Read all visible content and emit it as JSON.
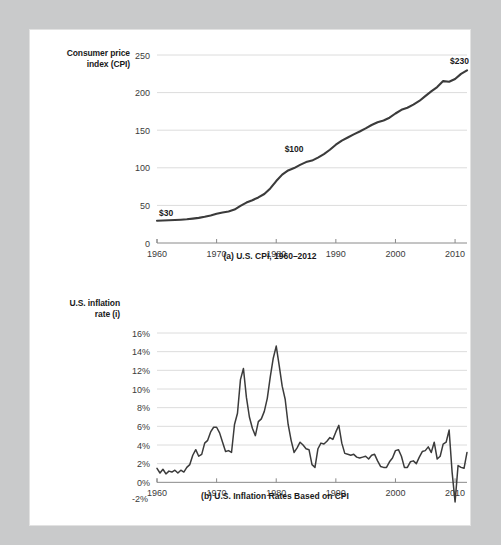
{
  "page": {
    "background_color": "#c9cacb",
    "paper_color": "#ffffff"
  },
  "figure_a": {
    "y_axis_title_line1": "Consumer price",
    "y_axis_title_line2": "index (CPI)",
    "caption": "(a) U.S. CPI, 1960–2012",
    "y_ticks": [
      "0",
      "50",
      "100",
      "150",
      "200",
      "250"
    ],
    "x_ticks": [
      "1960",
      "1970",
      "1980",
      "1990",
      "2000",
      "2010"
    ],
    "annotations": [
      {
        "label": "$30",
        "x_year": 1961.5,
        "y_value": 40
      },
      {
        "label": "$100",
        "x_year": 1981.5,
        "y_value": 118
      },
      {
        "label": "$230",
        "x_year": 2010.5,
        "y_value": 243
      }
    ]
  },
  "figure_b": {
    "y_axis_title_line1": "U.S. inflation",
    "y_axis_title_line2": "rate (i)",
    "caption": "(b) U.S. Inflation Rates Based on CPI",
    "y_ticks": [
      "-2%",
      "0%",
      "2%",
      "4%",
      "6%",
      "8%",
      "10%",
      "12%",
      "14%",
      "16%"
    ],
    "x_ticks": [
      "1960",
      "1970",
      "1980",
      "1990",
      "2000",
      "2010"
    ]
  },
  "chart_data": [
    {
      "type": "line",
      "id": "us-cpi",
      "title": "(a) U.S. CPI, 1960–2012",
      "xlabel": "",
      "ylabel": "Consumer price index (CPI)",
      "xlim": [
        1960,
        2012
      ],
      "ylim": [
        0,
        250
      ],
      "grid": true,
      "legend": "none",
      "x": [
        1960,
        1961,
        1962,
        1963,
        1964,
        1965,
        1966,
        1967,
        1968,
        1969,
        1970,
        1971,
        1972,
        1973,
        1974,
        1975,
        1976,
        1977,
        1978,
        1979,
        1980,
        1981,
        1982,
        1983,
        1984,
        1985,
        1986,
        1987,
        1988,
        1989,
        1990,
        1991,
        1992,
        1993,
        1994,
        1995,
        1996,
        1997,
        1998,
        1999,
        2000,
        2001,
        2002,
        2003,
        2004,
        2005,
        2006,
        2007,
        2008,
        2009,
        2010,
        2011,
        2012
      ],
      "values": [
        29.6,
        29.9,
        30.2,
        30.6,
        31.0,
        31.5,
        32.4,
        33.4,
        34.8,
        36.7,
        38.8,
        40.5,
        41.8,
        44.4,
        49.3,
        53.8,
        56.9,
        60.6,
        65.2,
        72.6,
        82.4,
        90.9,
        96.5,
        99.6,
        103.9,
        107.6,
        109.6,
        113.6,
        118.3,
        124.0,
        130.7,
        136.2,
        140.3,
        144.5,
        148.2,
        152.4,
        156.9,
        160.5,
        163.0,
        166.6,
        172.2,
        177.1,
        179.9,
        184.0,
        188.9,
        195.3,
        201.6,
        207.3,
        215.3,
        214.5,
        218.1,
        224.9,
        229.6
      ],
      "annotations": [
        {
          "text": "$30",
          "x": 1960,
          "y": 29.6
        },
        {
          "text": "$100",
          "x": 1983,
          "y": 99.6
        },
        {
          "text": "$230",
          "x": 2012,
          "y": 229.6
        }
      ]
    },
    {
      "type": "line",
      "id": "us-inflation-rate",
      "title": "(b) U.S. Inflation Rates Based on CPI",
      "xlabel": "",
      "ylabel": "U.S. inflation rate (i)",
      "xlim": [
        1960,
        2012
      ],
      "ylim": [
        -2,
        16
      ],
      "grid": true,
      "legend": "none",
      "x": [
        1960.0,
        1960.5,
        1961.0,
        1961.5,
        1962.0,
        1962.5,
        1963.0,
        1963.5,
        1964.0,
        1964.5,
        1965.0,
        1965.5,
        1966.0,
        1966.5,
        1967.0,
        1967.5,
        1968.0,
        1968.5,
        1969.0,
        1969.5,
        1970.0,
        1970.5,
        1971.0,
        1971.5,
        1972.0,
        1972.5,
        1973.0,
        1973.5,
        1974.0,
        1974.5,
        1975.0,
        1975.5,
        1976.0,
        1976.5,
        1977.0,
        1977.5,
        1978.0,
        1978.5,
        1979.0,
        1979.5,
        1980.0,
        1980.5,
        1981.0,
        1981.5,
        1982.0,
        1982.5,
        1983.0,
        1983.5,
        1984.0,
        1984.5,
        1985.0,
        1985.5,
        1986.0,
        1986.5,
        1987.0,
        1987.5,
        1988.0,
        1988.5,
        1989.0,
        1989.5,
        1990.0,
        1990.5,
        1991.0,
        1991.5,
        1992.0,
        1992.5,
        1993.0,
        1993.5,
        1994.0,
        1994.5,
        1995.0,
        1995.5,
        1996.0,
        1996.5,
        1997.0,
        1997.5,
        1998.0,
        1998.5,
        1999.0,
        1999.5,
        2000.0,
        2000.5,
        2001.0,
        2001.5,
        2002.0,
        2002.5,
        2003.0,
        2003.5,
        2004.0,
        2004.5,
        2005.0,
        2005.5,
        2006.0,
        2006.5,
        2007.0,
        2007.5,
        2008.0,
        2008.5,
        2009.0,
        2009.5,
        2010.0,
        2010.5,
        2011.0,
        2011.5,
        2012.0
      ],
      "values": [
        1.5,
        1.0,
        1.4,
        0.9,
        1.2,
        1.1,
        1.3,
        1.0,
        1.3,
        1.1,
        1.6,
        1.9,
        2.9,
        3.5,
        2.8,
        3.0,
        4.2,
        4.5,
        5.4,
        5.9,
        5.9,
        5.3,
        4.3,
        3.3,
        3.4,
        3.2,
        6.2,
        7.4,
        11.0,
        12.2,
        9.1,
        7.0,
        5.8,
        5.0,
        6.5,
        6.8,
        7.6,
        9.0,
        11.3,
        13.3,
        14.6,
        12.5,
        10.3,
        8.9,
        6.2,
        4.5,
        3.2,
        3.7,
        4.3,
        4.0,
        3.6,
        3.5,
        1.9,
        1.6,
        3.6,
        4.2,
        4.1,
        4.4,
        4.8,
        4.6,
        5.4,
        6.1,
        4.2,
        3.1,
        3.0,
        2.9,
        3.0,
        2.7,
        2.6,
        2.7,
        2.8,
        2.5,
        2.9,
        3.0,
        2.3,
        1.7,
        1.6,
        1.6,
        2.2,
        2.6,
        3.4,
        3.5,
        2.8,
        1.6,
        1.6,
        2.2,
        2.3,
        2.0,
        2.7,
        3.3,
        3.4,
        3.8,
        3.2,
        4.3,
        2.5,
        2.8,
        4.1,
        4.3,
        5.6,
        1.1,
        -2.1,
        1.8,
        1.6,
        1.5,
        3.2,
        3.0,
        2.1
      ]
    }
  ]
}
